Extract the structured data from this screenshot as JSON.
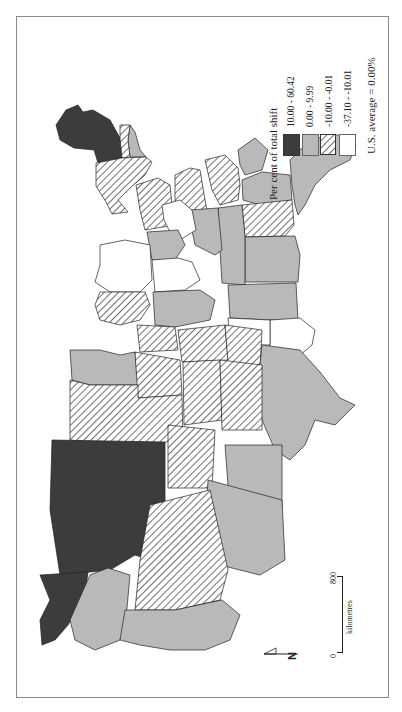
{
  "legend": {
    "title": "Per cent of total shift",
    "classes": [
      {
        "label": "10.00 - 60.42",
        "fill": "#3c3c3c",
        "pattern": "solid"
      },
      {
        "label": "0.00 - 9.99",
        "fill": "#b9b9b9",
        "pattern": "solid"
      },
      {
        "label": "-10.00 - -0.01",
        "fill": "#ffffff",
        "pattern": "diagonal-hatch"
      },
      {
        "label": "-37.10 - -10.01",
        "fill": "#ffffff",
        "pattern": "none"
      }
    ],
    "average_note": "U.S. average = 0.00%"
  },
  "scale_bar": {
    "start": "0",
    "end": "800",
    "unit": "kilometres"
  },
  "north_arrow": {
    "label": "N"
  },
  "map": {
    "subject": "United States, per cent of total shift by state",
    "orientation": "rotated 90 degrees counter-clockwise"
  }
}
